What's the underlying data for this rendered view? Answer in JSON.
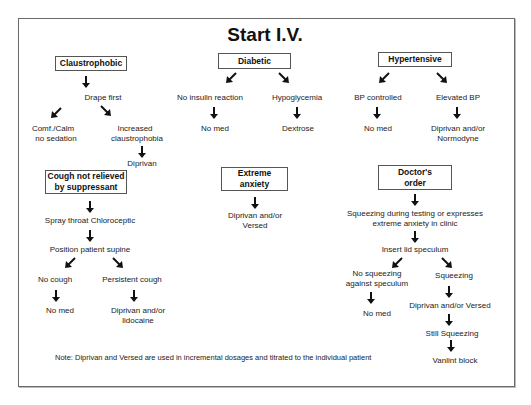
{
  "title": "Start I.V.",
  "columns": {
    "claustrophobic": {
      "header": "Claustrophobic",
      "step1": "Drape first",
      "left": "Comf./Calm no sedation",
      "left_lines": [
        "Comf./Calm",
        "no sedation"
      ],
      "right_lines": [
        "Increased",
        "claustrophobia"
      ],
      "right_result": "Diprivan"
    },
    "diabetic": {
      "header": "Diabetic",
      "left": "No insulin reaction",
      "left_result": "No med",
      "right": "Hypoglycemia",
      "right_result": "Dextrose"
    },
    "hypertensive": {
      "header": "Hypertensive",
      "left": "BP controlled",
      "left_result": "No med",
      "right": "Elevated BP",
      "right_result_lines": [
        "Diprivan and/or",
        "Normodyne"
      ]
    },
    "cough": {
      "header_lines": [
        "Cough not relieved",
        "by suppressant"
      ],
      "step1": "Spray throat Chloroceptic",
      "step2": "Position patient supine",
      "left": "No cough",
      "left_result": "No med",
      "right": "Persistent cough",
      "right_result_lines": [
        "Diprivan and/or",
        "lidocaine"
      ]
    },
    "anxiety": {
      "header_lines": [
        "Extreme",
        "anxiety"
      ],
      "result_lines": [
        "Diprivan and/or",
        "Versed"
      ]
    },
    "doctor": {
      "header_lines": [
        "Doctor's",
        "order"
      ],
      "step1_lines": [
        "Squeezing during testing or expresses",
        "extreme anxiety in clinic"
      ],
      "step2": "Insert lid speculum",
      "left_lines": [
        "No squeezing",
        "against speculum"
      ],
      "left_result": "No med",
      "right": "Squeezing",
      "right_step1": "Diprivan and/or Versed",
      "right_step2": "Still Squeezing",
      "right_result": "Vanlint block"
    }
  },
  "note": "Note: Diprivan and Versed are used in incremental dosages and titrated to the individual patient",
  "colors": {
    "line": "#555555",
    "text": "#222222",
    "background": "#ffffff"
  }
}
